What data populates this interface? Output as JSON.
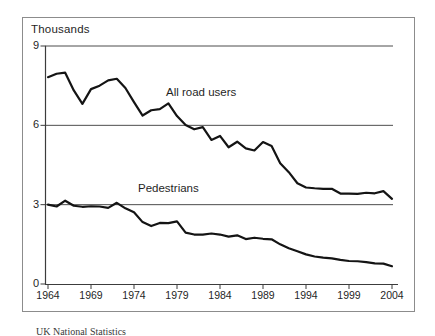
{
  "page": {
    "background": "#ffffff",
    "caption": "UK National Statistics"
  },
  "chart": {
    "frame_color": "#8c8c8c",
    "line_color": "#141414",
    "grid_color": "#4d4d4d",
    "axis_color": "#3c3c3c",
    "text_color": "#1f1f1f"
  },
  "chart_data": {
    "type": "line",
    "title": "",
    "unit_label": "Thousands",
    "xlabel": "",
    "ylabel": "Thousands",
    "ylim": [
      0,
      9
    ],
    "grid": "horizontal",
    "grid_values": [
      3,
      6,
      9
    ],
    "y_ticks": [
      9,
      6,
      3,
      0
    ],
    "x_tick_years": [
      "1964",
      "1969",
      "1974",
      "1979",
      "1984",
      "1989",
      "1994",
      "1999",
      "2004"
    ],
    "legend_position": "inline-labels",
    "x": [
      1964,
      1965,
      1966,
      1967,
      1968,
      1969,
      1970,
      1971,
      1972,
      1973,
      1974,
      1975,
      1976,
      1977,
      1978,
      1979,
      1980,
      1981,
      1982,
      1983,
      1984,
      1985,
      1986,
      1987,
      1988,
      1989,
      1990,
      1991,
      1992,
      1993,
      1994,
      1995,
      1996,
      1997,
      1998,
      1999,
      2000,
      2001,
      2002,
      2003,
      2004
    ],
    "series": [
      {
        "name": "All road users",
        "values": [
          7.82,
          7.95,
          7.99,
          7.32,
          6.81,
          7.37,
          7.5,
          7.7,
          7.76,
          7.41,
          6.88,
          6.37,
          6.57,
          6.61,
          6.83,
          6.35,
          6.01,
          5.85,
          5.93,
          5.45,
          5.6,
          5.17,
          5.38,
          5.13,
          5.05,
          5.37,
          5.22,
          4.57,
          4.23,
          3.81,
          3.65,
          3.62,
          3.6,
          3.6,
          3.42,
          3.42,
          3.41,
          3.45,
          3.43,
          3.51,
          3.22
        ]
      },
      {
        "name": "Pedestrians",
        "values": [
          3.0,
          2.93,
          3.15,
          2.96,
          2.92,
          2.94,
          2.93,
          2.88,
          3.07,
          2.86,
          2.71,
          2.34,
          2.19,
          2.31,
          2.3,
          2.37,
          1.94,
          1.87,
          1.87,
          1.91,
          1.87,
          1.79,
          1.84,
          1.7,
          1.75,
          1.71,
          1.69,
          1.5,
          1.35,
          1.24,
          1.12,
          1.04,
          1.0,
          0.97,
          0.91,
          0.87,
          0.86,
          0.83,
          0.78,
          0.77,
          0.67
        ]
      }
    ]
  }
}
